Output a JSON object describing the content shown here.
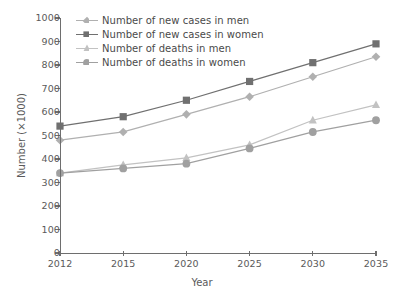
{
  "chart_data": {
    "type": "line",
    "title": "",
    "xlabel": "Year",
    "ylabel": "Number (×1000)",
    "x": [
      2012,
      2015,
      2020,
      2025,
      2030,
      2035
    ],
    "xtick_labels": [
      "2012",
      "2015",
      "2020",
      "2025",
      "2030",
      "2035"
    ],
    "ytick_labels": [
      "0",
      "100",
      "200",
      "300",
      "400",
      "500",
      "600",
      "700",
      "800",
      "900",
      "1000"
    ],
    "yticks": [
      0,
      100,
      200,
      300,
      400,
      500,
      600,
      700,
      800,
      900,
      1000
    ],
    "ylim": [
      0,
      1000
    ],
    "xlim": [
      2012,
      2035
    ],
    "grid": false,
    "legend_position": "top-left",
    "series": [
      {
        "name": "Number of new cases in men",
        "marker": "diamond",
        "color": "#b0b0b0",
        "values": [
          480,
          515,
          590,
          665,
          750,
          835
        ]
      },
      {
        "name": "Number of new cases in women",
        "marker": "square",
        "color": "#707070",
        "values": [
          540,
          580,
          650,
          730,
          810,
          890
        ]
      },
      {
        "name": "Number of deaths in men",
        "marker": "triangle",
        "color": "#c2c2c2",
        "values": [
          340,
          375,
          405,
          460,
          565,
          630
        ]
      },
      {
        "name": "Number of deaths in women",
        "marker": "circle",
        "color": "#a0a0a0",
        "values": [
          340,
          360,
          380,
          445,
          515,
          565
        ]
      }
    ]
  },
  "axes": {
    "x_title": "Year",
    "y_title": "Number (×1000)"
  },
  "legend": {
    "items": [
      {
        "label": "Number of new cases in men"
      },
      {
        "label": "Number of new cases in women"
      },
      {
        "label": "Number of deaths in men"
      },
      {
        "label": "Number of deaths in women"
      }
    ]
  },
  "colors": {
    "axis": "#6e6e6e",
    "text": "#5a5a5a",
    "background": "#ffffff"
  }
}
